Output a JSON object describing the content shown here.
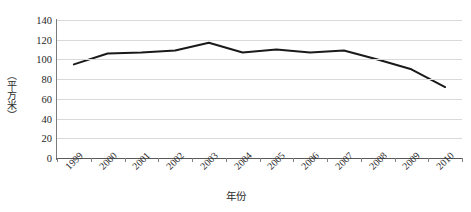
{
  "chart_data": {
    "type": "line",
    "title": "",
    "subtitle": "",
    "xlabel": "年份",
    "ylabel": "（平方米）",
    "categories": [
      "1999",
      "2000",
      "2001",
      "2002",
      "2003",
      "2004",
      "2005",
      "2006",
      "2007",
      "2008",
      "2009",
      "2010"
    ],
    "values": [
      95,
      106,
      107,
      109,
      117,
      107,
      110,
      107,
      109,
      100,
      90,
      72
    ],
    "series": [
      {
        "name": "",
        "values": [
          95,
          106,
          107,
          109,
          117,
          107,
          110,
          107,
          109,
          100,
          90,
          72
        ]
      }
    ],
    "ylim": [
      0,
      140
    ],
    "yticks": [
      0,
      20,
      40,
      60,
      80,
      100,
      120,
      140
    ],
    "ytick_labels": [
      "0",
      "20",
      "40",
      "60",
      "80",
      "100",
      "120",
      "140"
    ],
    "xlim_categories": [
      "1999",
      "2010"
    ],
    "grid": "horizontal",
    "legend": "none",
    "line_color": "#1a1a1a",
    "line_width": 2,
    "grid_color": "#d9d9d9",
    "axis_color": "#595959",
    "background": "#ffffff",
    "markers": "none",
    "annotations": []
  }
}
